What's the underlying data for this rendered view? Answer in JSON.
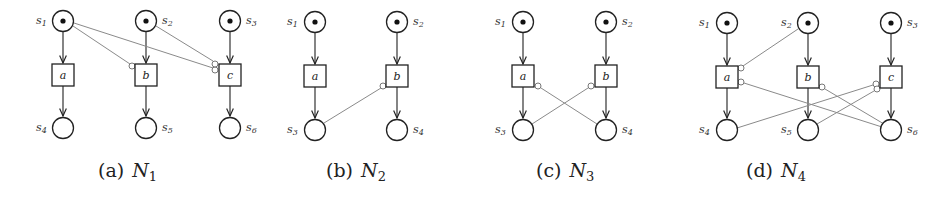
{
  "figure": {
    "panels": [
      {
        "id": "a",
        "caption_prefix": "(a)",
        "caption_net": "N",
        "caption_sub": "1",
        "places": [
          {
            "name": "s1",
            "label_base": "s",
            "label_sub": "1",
            "x": 63,
            "y": 21,
            "token": true,
            "label_side": "left"
          },
          {
            "name": "s2",
            "label_base": "s",
            "label_sub": "2",
            "x": 146,
            "y": 21,
            "token": true,
            "label_side": "right"
          },
          {
            "name": "s3",
            "label_base": "s",
            "label_sub": "3",
            "x": 230,
            "y": 21,
            "token": true,
            "label_side": "right"
          },
          {
            "name": "s4",
            "label_base": "s",
            "label_sub": "4",
            "x": 63,
            "y": 128,
            "token": false,
            "label_side": "left"
          },
          {
            "name": "s5",
            "label_base": "s",
            "label_sub": "5",
            "x": 146,
            "y": 128,
            "token": false,
            "label_side": "right"
          },
          {
            "name": "s6",
            "label_base": "s",
            "label_sub": "6",
            "x": 230,
            "y": 128,
            "token": false,
            "label_side": "right"
          }
        ],
        "transitions": [
          {
            "name": "a",
            "x": 63,
            "y": 75
          },
          {
            "name": "b",
            "x": 146,
            "y": 75
          },
          {
            "name": "c",
            "x": 230,
            "y": 75
          }
        ]
      },
      {
        "id": "b",
        "caption_prefix": "(b)",
        "caption_net": "N",
        "caption_sub": "2",
        "places": [
          {
            "name": "s1",
            "label_base": "s",
            "label_sub": "1",
            "x": 315,
            "y": 22,
            "token": true,
            "label_side": "left"
          },
          {
            "name": "s2",
            "label_base": "s",
            "label_sub": "2",
            "x": 397,
            "y": 22,
            "token": true,
            "label_side": "right"
          },
          {
            "name": "s3",
            "label_base": "s",
            "label_sub": "3",
            "x": 315,
            "y": 130,
            "token": false,
            "label_side": "left"
          },
          {
            "name": "s4",
            "label_base": "s",
            "label_sub": "4",
            "x": 397,
            "y": 130,
            "token": false,
            "label_side": "right"
          }
        ],
        "transitions": [
          {
            "name": "a",
            "x": 315,
            "y": 76
          },
          {
            "name": "b",
            "x": 397,
            "y": 76
          }
        ]
      },
      {
        "id": "c",
        "caption_prefix": "(c)",
        "caption_net": "N",
        "caption_sub": "3",
        "places": [
          {
            "name": "s1",
            "label_base": "s",
            "label_sub": "1",
            "x": 523,
            "y": 22,
            "token": true,
            "label_side": "left"
          },
          {
            "name": "s2",
            "label_base": "s",
            "label_sub": "2",
            "x": 606,
            "y": 22,
            "token": true,
            "label_side": "right"
          },
          {
            "name": "s3",
            "label_base": "s",
            "label_sub": "3",
            "x": 523,
            "y": 130,
            "token": false,
            "label_side": "left"
          },
          {
            "name": "s4",
            "label_base": "s",
            "label_sub": "4",
            "x": 606,
            "y": 130,
            "token": false,
            "label_side": "right"
          }
        ],
        "transitions": [
          {
            "name": "a",
            "x": 523,
            "y": 76
          },
          {
            "name": "b",
            "x": 606,
            "y": 76
          }
        ]
      },
      {
        "id": "d",
        "caption_prefix": "(d)",
        "caption_net": "N",
        "caption_sub": "4",
        "places": [
          {
            "name": "s1",
            "label_base": "s",
            "label_sub": "1",
            "x": 727,
            "y": 23,
            "token": true,
            "label_side": "left"
          },
          {
            "name": "s2",
            "label_base": "s",
            "label_sub": "2",
            "x": 808,
            "y": 23,
            "token": true,
            "label_side": "left"
          },
          {
            "name": "s3",
            "label_base": "s",
            "label_sub": "3",
            "x": 891,
            "y": 23,
            "token": true,
            "label_side": "right"
          },
          {
            "name": "s4",
            "label_base": "s",
            "label_sub": "4",
            "x": 727,
            "y": 130,
            "token": false,
            "label_side": "left"
          },
          {
            "name": "s5",
            "label_base": "s",
            "label_sub": "5",
            "x": 808,
            "y": 130,
            "token": false,
            "label_side": "left"
          },
          {
            "name": "s6",
            "label_base": "s",
            "label_sub": "6",
            "x": 891,
            "y": 130,
            "token": false,
            "label_side": "right"
          }
        ],
        "transitions": [
          {
            "name": "a",
            "x": 727,
            "y": 77
          },
          {
            "name": "b",
            "x": 808,
            "y": 77
          },
          {
            "name": "c",
            "x": 891,
            "y": 77
          }
        ]
      }
    ],
    "arc_types": {
      "normal": "arrow from place to transition or transition to place",
      "inhibitor": "grey line ending in small open circle at transition"
    }
  }
}
